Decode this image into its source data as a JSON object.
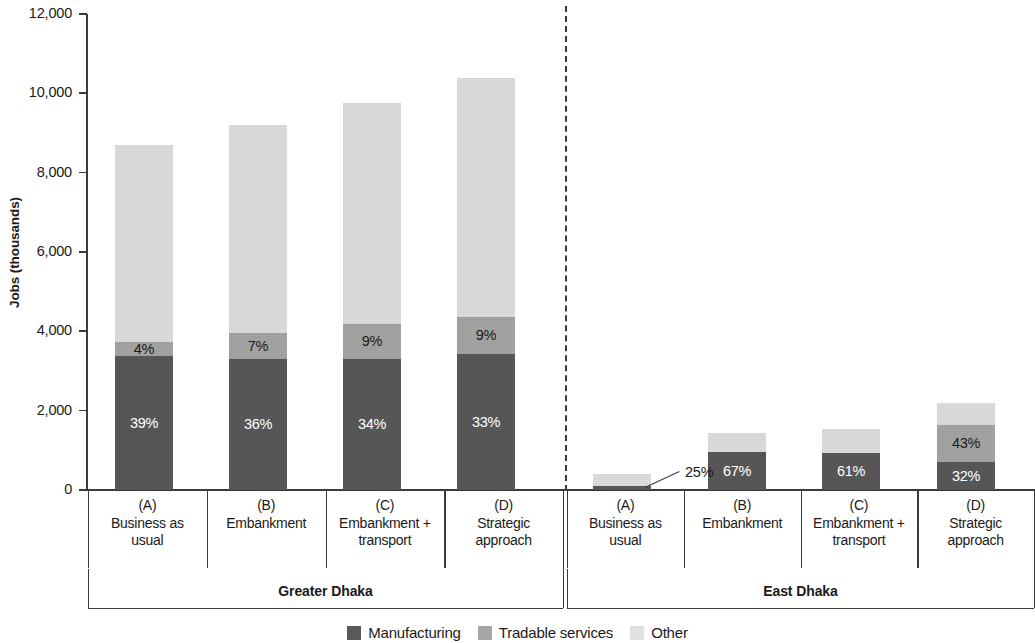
{
  "chart_data": {
    "type": "bar",
    "subtype": "stacked-bar",
    "title": "",
    "xlabel": "",
    "ylabel": "Jobs (thousands)",
    "ylim": [
      0,
      12000
    ],
    "y_ticks": [
      0,
      2000,
      4000,
      6000,
      8000,
      10000,
      12000
    ],
    "y_tick_labels": [
      "0",
      "2,000",
      "4,000",
      "6,000",
      "8,000",
      "10,000",
      "12,000"
    ],
    "grid": false,
    "legend_position": "bottom",
    "legend": [
      "Manufacturing",
      "Tradable services",
      "Other"
    ],
    "series": [
      {
        "name": "Manufacturing",
        "color": "#595959",
        "values": [
          3390,
          3310,
          3310,
          3430,
          100,
          970,
          945,
          700
        ]
      },
      {
        "name": "Tradable services",
        "color": "#a6a6a6",
        "values": [
          350,
          645,
          880,
          935,
          0,
          0,
          0,
          945
        ]
      },
      {
        "name": "Other",
        "color": "#e0e0e0",
        "values": [
          4960,
          5245,
          5560,
          6035,
          300,
          480,
          605,
          555
        ]
      }
    ],
    "totals": [
      8700,
      9200,
      9750,
      10400,
      400,
      1450,
      1550,
      2200
    ],
    "groups": [
      {
        "name": "Greater Dhaka",
        "categories": [
          {
            "code": "(A)",
            "name": "Business as usual"
          },
          {
            "code": "(B)",
            "name": "Embankment"
          },
          {
            "code": "(C)",
            "name": "Embankment + transport"
          },
          {
            "code": "(D)",
            "name": "Strategic approach"
          }
        ]
      },
      {
        "name": "East Dhaka",
        "categories": [
          {
            "code": "(A)",
            "name": "Business as usual"
          },
          {
            "code": "(B)",
            "name": "Embankment"
          },
          {
            "code": "(C)",
            "name": "Embankment + transport"
          },
          {
            "code": "(D)",
            "name": "Strategic approach"
          }
        ]
      }
    ],
    "bars": [
      {
        "group": "Greater Dhaka",
        "code": "(A)",
        "segments": [
          {
            "series": "Manufacturing",
            "value": 3390,
            "label": "39%"
          },
          {
            "series": "Tradable services",
            "value": 350,
            "label": "4%"
          },
          {
            "series": "Other",
            "value": 4960,
            "label": ""
          }
        ]
      },
      {
        "group": "Greater Dhaka",
        "code": "(B)",
        "segments": [
          {
            "series": "Manufacturing",
            "value": 3310,
            "label": "36%"
          },
          {
            "series": "Tradable services",
            "value": 645,
            "label": "7%"
          },
          {
            "series": "Other",
            "value": 5245,
            "label": ""
          }
        ]
      },
      {
        "group": "Greater Dhaka",
        "code": "(C)",
        "segments": [
          {
            "series": "Manufacturing",
            "value": 3310,
            "label": "34%"
          },
          {
            "series": "Tradable services",
            "value": 880,
            "label": "9%"
          },
          {
            "series": "Other",
            "value": 5560,
            "label": ""
          }
        ]
      },
      {
        "group": "Greater Dhaka",
        "code": "(D)",
        "segments": [
          {
            "series": "Manufacturing",
            "value": 3430,
            "label": "33%"
          },
          {
            "series": "Tradable services",
            "value": 935,
            "label": "9%"
          },
          {
            "series": "Other",
            "value": 6035,
            "label": ""
          }
        ]
      },
      {
        "group": "East Dhaka",
        "code": "(A)",
        "segments": [
          {
            "series": "Manufacturing",
            "value": 100,
            "label": ""
          },
          {
            "series": "Tradable services",
            "value": 0,
            "label": ""
          },
          {
            "series": "Other",
            "value": 300,
            "label": ""
          }
        ],
        "callout": "25%"
      },
      {
        "group": "East Dhaka",
        "code": "(B)",
        "segments": [
          {
            "series": "Manufacturing",
            "value": 970,
            "label": "67%"
          },
          {
            "series": "Tradable services",
            "value": 0,
            "label": ""
          },
          {
            "series": "Other",
            "value": 480,
            "label": ""
          }
        ]
      },
      {
        "group": "East Dhaka",
        "code": "(C)",
        "segments": [
          {
            "series": "Manufacturing",
            "value": 945,
            "label": "61%"
          },
          {
            "series": "Tradable services",
            "value": 0,
            "label": ""
          },
          {
            "series": "Other",
            "value": 605,
            "label": ""
          }
        ]
      },
      {
        "group": "East Dhaka",
        "code": "(D)",
        "segments": [
          {
            "series": "Manufacturing",
            "value": 700,
            "label": "32%"
          },
          {
            "series": "Tradable services",
            "value": 945,
            "label": "43%"
          },
          {
            "series": "Other",
            "value": 555,
            "label": ""
          }
        ]
      }
    ],
    "colors": {
      "manufacturing": "#595959",
      "tradable_services": "#a6a6a6",
      "other": "#e0e0e0",
      "axis": "#3b3b3b",
      "text": "#1a1a1a"
    }
  }
}
